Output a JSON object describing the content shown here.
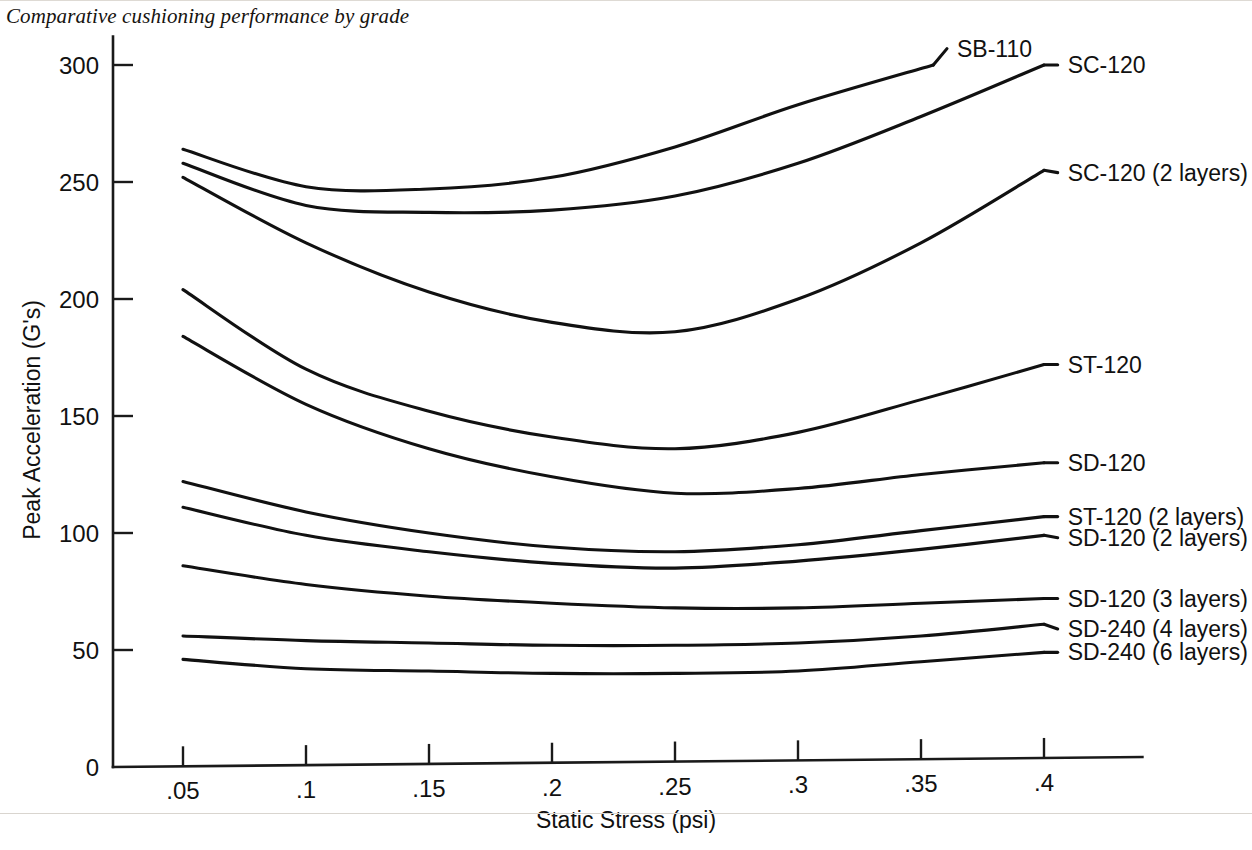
{
  "figure": {
    "title": "Comparative cushioning performance by grade"
  },
  "chart_data": {
    "type": "line",
    "title": "Comparative cushioning performance by grade",
    "xlabel": "Static Stress (psi)",
    "ylabel": "Peak Acceleration (G's)",
    "xlim": [
      0.0,
      0.44
    ],
    "ylim": [
      0,
      310
    ],
    "grid": false,
    "legend_position": "right-inline-labels",
    "xticks": [
      0.05,
      0.1,
      0.15,
      0.2,
      0.25,
      0.3,
      0.35,
      0.4
    ],
    "xtick_labels": [
      ".05",
      ".1",
      ".15",
      ".2",
      ".25",
      ".3",
      ".35",
      ".4"
    ],
    "yticks": [
      0,
      50,
      100,
      150,
      200,
      250,
      300
    ],
    "ytick_labels": [
      "0",
      "50",
      "100",
      "150",
      "200",
      "250",
      "300"
    ],
    "x": [
      0.05,
      0.1,
      0.15,
      0.2,
      0.25,
      0.3,
      0.35,
      0.4
    ],
    "series": [
      {
        "name": "SB-110",
        "label": "SB-110",
        "x": [
          0.05,
          0.1,
          0.15,
          0.2,
          0.25,
          0.3,
          0.355
        ],
        "values": [
          264,
          248,
          247,
          252,
          265,
          283,
          300
        ],
        "label_x": 0.363,
        "label_y": 307
      },
      {
        "name": "SC-120",
        "label": "SC-120",
        "x": [
          0.05,
          0.1,
          0.15,
          0.2,
          0.25,
          0.3,
          0.35,
          0.4
        ],
        "values": [
          258,
          240,
          237,
          238,
          244,
          258,
          278,
          300
        ],
        "label_x": 0.408,
        "label_y": 300
      },
      {
        "name": "SC-120 (2 layers)",
        "label": "SC-120 (2 layers)",
        "x": [
          0.05,
          0.1,
          0.15,
          0.2,
          0.25,
          0.3,
          0.35,
          0.4
        ],
        "values": [
          252,
          224,
          203,
          190,
          186,
          200,
          224,
          255
        ],
        "label_x": 0.408,
        "label_y": 254
      },
      {
        "name": "ST-120",
        "label": "ST-120",
        "x": [
          0.05,
          0.1,
          0.15,
          0.2,
          0.25,
          0.3,
          0.35,
          0.4
        ],
        "values": [
          204,
          170,
          152,
          141,
          136,
          143,
          157,
          172
        ],
        "label_x": 0.408,
        "label_y": 172
      },
      {
        "name": "SD-120",
        "label": "SD-120",
        "x": [
          0.05,
          0.1,
          0.15,
          0.2,
          0.25,
          0.3,
          0.35,
          0.4
        ],
        "values": [
          184,
          155,
          136,
          124,
          117,
          119,
          125,
          130
        ],
        "label_x": 0.408,
        "label_y": 130
      },
      {
        "name": "ST-120 (2 layers)",
        "label": "ST-120 (2 layers)",
        "x": [
          0.05,
          0.1,
          0.15,
          0.2,
          0.25,
          0.3,
          0.35,
          0.4
        ],
        "values": [
          122,
          109,
          100,
          94,
          92,
          95,
          101,
          107
        ],
        "label_x": 0.408,
        "label_y": 107
      },
      {
        "name": "SD-120 (2 layers)",
        "label": "SD-120 (2 layers)",
        "x": [
          0.05,
          0.1,
          0.15,
          0.2,
          0.25,
          0.3,
          0.35,
          0.4
        ],
        "values": [
          111,
          99,
          92,
          87,
          85,
          88,
          93,
          99
        ],
        "label_x": 0.408,
        "label_y": 98
      },
      {
        "name": "SD-120 (3 layers)",
        "label": "SD-120 (3 layers)",
        "x": [
          0.05,
          0.1,
          0.15,
          0.2,
          0.25,
          0.3,
          0.35,
          0.4
        ],
        "values": [
          86,
          78,
          73,
          70,
          68,
          68,
          70,
          72
        ],
        "label_x": 0.408,
        "label_y": 72
      },
      {
        "name": "SD-240 (4 layers)",
        "label": "SD-240 (4 layers)",
        "x": [
          0.05,
          0.1,
          0.15,
          0.2,
          0.25,
          0.3,
          0.35,
          0.4
        ],
        "values": [
          56,
          54,
          53,
          52,
          52,
          53,
          56,
          61
        ],
        "label_x": 0.408,
        "label_y": 59
      },
      {
        "name": "SD-240 (6 layers)",
        "label": "SD-240 (6 layers)",
        "x": [
          0.05,
          0.1,
          0.15,
          0.2,
          0.25,
          0.3,
          0.35,
          0.4
        ],
        "values": [
          46,
          42,
          41,
          40,
          40,
          41,
          45,
          49
        ],
        "label_x": 0.408,
        "label_y": 49
      }
    ]
  },
  "axes": {
    "x_title": "Static Stress (psi)",
    "y_title": "Peak Acceleration (G's)"
  },
  "colors": {
    "ink": "#111111",
    "paper": "#ffffff"
  }
}
